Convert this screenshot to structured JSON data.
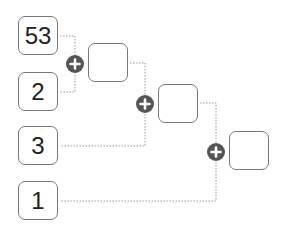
{
  "inputs": [
    {
      "value": "53"
    },
    {
      "value": "2"
    },
    {
      "value": "3"
    },
    {
      "value": "1"
    }
  ],
  "results": [
    {
      "value": ""
    },
    {
      "value": ""
    },
    {
      "value": ""
    }
  ],
  "operators": [
    {
      "icon": "plus-icon",
      "symbol": "+"
    },
    {
      "icon": "plus-icon",
      "symbol": "+"
    },
    {
      "icon": "plus-icon",
      "symbol": "+"
    }
  ],
  "colors": {
    "border": "#777777",
    "operator": "#555555",
    "connector": "#999999"
  }
}
